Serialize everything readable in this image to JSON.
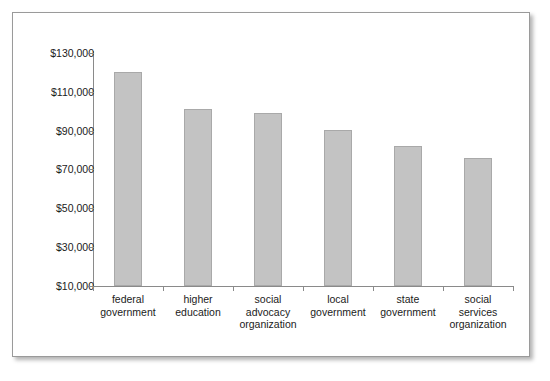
{
  "chart_data": {
    "type": "bar",
    "title": "",
    "subtitle": "",
    "xlabel": "",
    "ylabel": "",
    "categories": [
      "federal government",
      "higher education",
      "social advocacy organization",
      "local government",
      "state government",
      "social services organization"
    ],
    "category_lines": [
      [
        "federal",
        "government"
      ],
      [
        "higher",
        "education"
      ],
      [
        "social",
        "advocacy",
        "organization"
      ],
      [
        "local",
        "government"
      ],
      [
        "state",
        "government"
      ],
      [
        "social",
        "services",
        "organization"
      ]
    ],
    "values": [
      120000,
      101000,
      99000,
      90500,
      82000,
      76000
    ],
    "ylim": [
      10000,
      130000
    ],
    "ytick_values": [
      130000,
      110000,
      90000,
      70000,
      50000,
      30000,
      10000
    ],
    "ytick_labels": [
      "$130,000",
      "$110,000",
      "$90,000",
      "$70,000",
      "$50,000",
      "$30,000",
      "$10,000"
    ],
    "grid": false,
    "legend": null,
    "bar_color": "#c3c3c3",
    "bar_border_color": "#a9a9a9",
    "axis_color": "#8a8a8a",
    "text_color": "#1b1b1b",
    "background": "#ffffff"
  }
}
